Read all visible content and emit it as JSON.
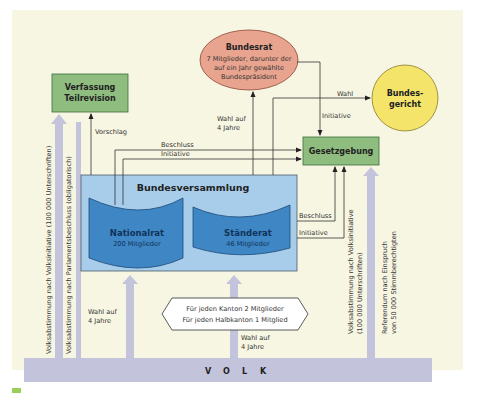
{
  "diagram": {
    "colors": {
      "background": "#f7f6e2",
      "volk_bar": "#c4c3dc",
      "green_box": "#8fbc7f",
      "green_box_border": "#3a6e3a",
      "bundesrat_fill": "#e9a48f",
      "bundesgericht_fill": "#f4e56a",
      "bundesversammlung_fill": "#a8cdea",
      "chamber_fill": "#3f86c4",
      "chamber_text": "#10335a"
    },
    "nodes": {
      "verfassung": {
        "line1": "Verfassung",
        "line2": "Teilrevision"
      },
      "bundesrat": {
        "title": "Bundesrat",
        "line1": "7 Mitglieder, darunter der",
        "line2": "auf ein Jahr gewählte",
        "line3": "Bundespräsident"
      },
      "bundesgericht": {
        "line1": "Bundes-",
        "line2": "gericht"
      },
      "gesetzgebung": {
        "label": "Gesetzgebung"
      },
      "bundesversammlung": {
        "label": "Bundesversammlung"
      },
      "nationalrat": {
        "title": "Nationalrat",
        "members": "200 Mitglieder"
      },
      "staenderat": {
        "title": "Ständerat",
        "members": "46 Mitglieder"
      },
      "kanton_note": {
        "line1": "Für jeden Kanton 2 Mitglieder",
        "line2": "Für jeden Halbkanton 1 Mitglied"
      },
      "volk": {
        "letters": [
          "V",
          "O",
          "L",
          "K"
        ]
      }
    },
    "edges": {
      "vorschlag": "Vorschlag",
      "beschluss_top": "Beschluss",
      "initiative_top": "Initiative",
      "wahl_bundesrat_1": "Wahl auf",
      "wahl_bundesrat_2": "4 Jahre",
      "wahl_gericht": "Wahl",
      "initiative_bundesrat": "Initiative",
      "beschluss_right": "Beschluss",
      "initiative_right": "Initiative",
      "wahl_nationalrat_1": "Wahl auf",
      "wahl_nationalrat_2": "4 Jahre",
      "wahl_staenderat_1": "Wahl auf",
      "wahl_staenderat_2": "4 Jahre"
    },
    "vertical_labels": {
      "volksinitiative_verfassung": "Volksabstimmung nach Volksinitiative (100 000 Unterschriften)",
      "parlamentsbeschluss": "Volksabstimmung nach Parlamentsbeschluss (obligatorisch)",
      "volksinitiative_gesetz_1": "Volksabstimmung nach Volksinitiative",
      "volksinitiative_gesetz_2": "(100 000 Unterschriften)",
      "referendum_1": "Referendum nach Einspruch",
      "referendum_2": "von 50 000 Stimmberechtigten"
    }
  }
}
